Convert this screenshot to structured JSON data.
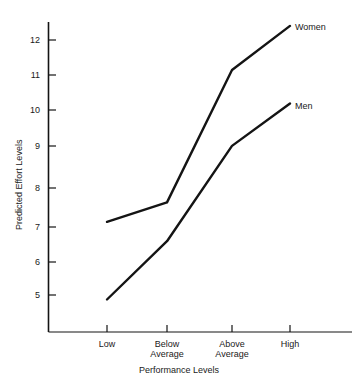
{
  "chart_data": {
    "type": "line",
    "title": "",
    "xlabel": "Performance Levels",
    "ylabel": "Predicted Effort Levels",
    "categories": [
      "Low",
      "Below Average",
      "Above Average",
      "High"
    ],
    "category_lines": [
      [
        "Low",
        ""
      ],
      [
        "Below",
        "Average"
      ],
      [
        "Above",
        "Average"
      ],
      [
        "High",
        ""
      ]
    ],
    "yticks": [
      5,
      6,
      7,
      8,
      9,
      10,
      11,
      12
    ],
    "ytick_labels": [
      "5",
      "6",
      "7",
      "8",
      "9",
      "10",
      "11",
      "12"
    ],
    "ylim": [
      4.3,
      12.7
    ],
    "grid": false,
    "legend_position": "inline-right",
    "series": [
      {
        "name": "Women",
        "label": "Women",
        "color": "#141414",
        "values": [
          6.85,
          7.4,
          11.15,
          12.4
        ]
      },
      {
        "name": "Men",
        "label": "Men",
        "color": "#141414",
        "values": [
          4.65,
          6.3,
          9.0,
          10.2
        ]
      }
    ]
  },
  "axes": {
    "y_axis_title": "Predicted Effort Levels",
    "x_axis_title": "Performance Levels"
  }
}
